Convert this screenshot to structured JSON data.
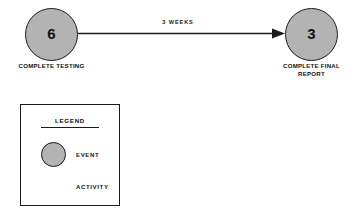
{
  "diagram": {
    "type": "network-activity-diagram",
    "background_color": "#ffffff",
    "node_fill_color": "#b3b3b3",
    "node_stroke_color": "#1a1a1a",
    "line_color": "#1a1a1a",
    "text_color": "#111111",
    "nodes": [
      {
        "id": "node-6",
        "number": "6",
        "label": "COMPLETE TESTING"
      },
      {
        "id": "node-3",
        "number": "3",
        "label": "COMPLETE FINAL\nREPORT"
      }
    ],
    "edges": [
      {
        "id": "edge-6-to-3",
        "from": "6",
        "to": "3",
        "label": "3  WEEKS",
        "duration_value": "3",
        "duration_unit": "WEEKS",
        "arrowhead": "filled-triangle"
      }
    ]
  },
  "legend": {
    "title": "LEGEND",
    "items": [
      {
        "symbol": "circle",
        "label": "EVENT"
      },
      {
        "symbol": "arrow",
        "label": "ACTIVITY"
      }
    ]
  }
}
